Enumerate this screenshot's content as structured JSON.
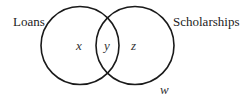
{
  "diagram": {
    "type": "venn",
    "sets": [
      {
        "id": "loans",
        "label": "Loans"
      },
      {
        "id": "scholarships",
        "label": "Scholarships"
      }
    ],
    "regions": {
      "loans_only": "x",
      "both": "y",
      "scholarships_only": "z",
      "neither": "w"
    },
    "colors": {
      "stroke": "#1a1a1a",
      "text": "#222222",
      "background": "#ffffff"
    }
  }
}
